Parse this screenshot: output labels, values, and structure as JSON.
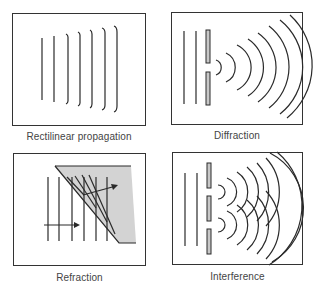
{
  "diagram": {
    "title": "",
    "panels": [
      {
        "id": "rectilinear",
        "label": "Rectilinear propagation"
      },
      {
        "id": "diffraction",
        "label": "Diffraction"
      },
      {
        "id": "refraction",
        "label": "Refraction"
      },
      {
        "id": "interference",
        "label": "Interference"
      }
    ],
    "colors": {
      "line": "#2a2a2a",
      "border": "#333333",
      "medium_fill": "#d3d3d3",
      "barrier_fill": "#c8c8c8",
      "label_text": "#444444"
    }
  }
}
